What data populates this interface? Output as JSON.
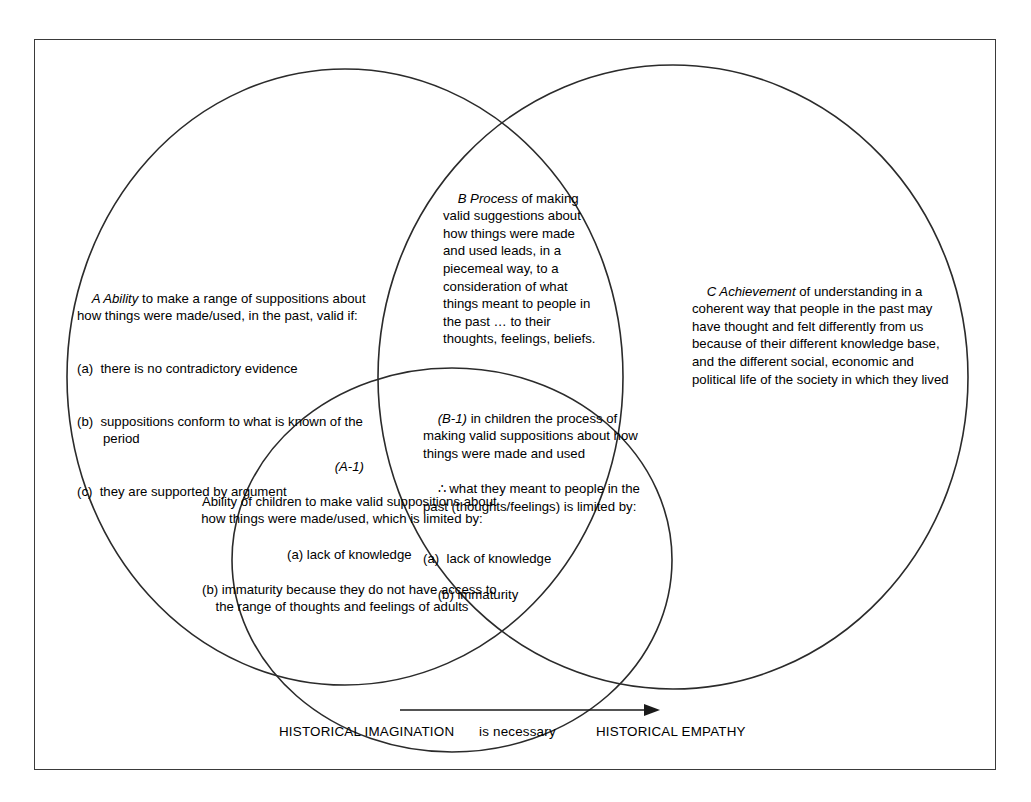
{
  "diagram": {
    "regions": {
      "a": {
        "tag": "A Ability",
        "lead": "A Ability",
        "body": " to make a range of suppositions about how things were made/used, in the past, valid if:",
        "items": [
          "(a)  there is no contradictory evidence",
          "(b)  suppositions conform to what is known of the period",
          "(c)  they are supported by argument"
        ]
      },
      "b": {
        "lead": "B Process",
        "body": " of making valid suggestions about how things were made and used leads, in a piecemeal way, to a consideration of what things meant to people in the past … to their thoughts, feelings, beliefs."
      },
      "c": {
        "lead": "C Achievement",
        "body": " of understanding in a coherent way that people in the past may have thought and felt differently from us because of their different knowledge base, and the different social, economic and political life of the society in which they lived"
      },
      "b1": {
        "lead": "(B-1)",
        "body": " in children the process of making valid suppositions about how things were made and used",
        "therefore_symbol": "∴",
        "therefore_text": " what they meant to people in the past (thoughts/feelings) is limited by:",
        "items": [
          "(a)  lack of knowledge",
          "(b) immaturity"
        ]
      },
      "a1": {
        "lead": "(A-1)",
        "body": "Ability of children to make valid suppositions about how things were made/used, which is limited by:",
        "items": [
          "(a) lack of knowledge",
          "(b) immaturity because they do not have access to the range of thoughts and feelings of adults"
        ]
      }
    },
    "axis": {
      "left_label": "HISTORICAL IMAGINATION",
      "middle_label": "is necessary",
      "right_label": "HISTORICAL EMPATHY",
      "arrow_direction": "right"
    },
    "colors": {
      "stroke": "#2b2b2b",
      "frame": "#3a3a3a",
      "text": "#000000",
      "background": "#ffffff"
    }
  }
}
